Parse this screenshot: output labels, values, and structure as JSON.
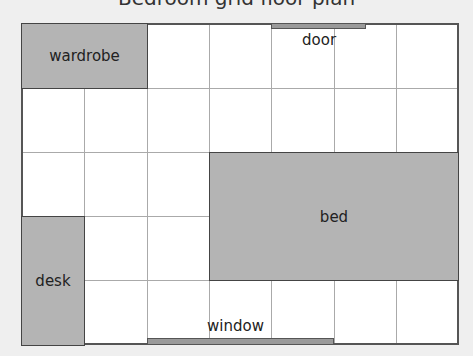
{
  "caption": "Bedroom grid floor plan",
  "grid": {
    "columns": 7,
    "rows": 5
  },
  "furniture": {
    "wardrobe": {
      "label": "wardrobe"
    },
    "bed": {
      "label": "bed"
    },
    "desk": {
      "label": "desk"
    }
  },
  "openings": {
    "door": {
      "label": "door"
    },
    "window": {
      "label": "window"
    }
  },
  "colors": {
    "furniture": "#b4b4b4",
    "background": "#efefef",
    "room": "#ffffff"
  }
}
